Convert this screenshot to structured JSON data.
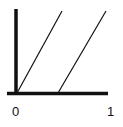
{
  "diagram": {
    "type": "line-diagram",
    "axes": {
      "x_tick_labels": [
        "0",
        "1"
      ],
      "color": "#111111"
    },
    "lines": [
      {
        "name": "line-1",
        "from": [
          17,
          93
        ],
        "to": [
          62,
          11
        ]
      },
      {
        "name": "line-2",
        "from": [
          58,
          93
        ],
        "to": [
          106,
          11
        ]
      }
    ]
  }
}
